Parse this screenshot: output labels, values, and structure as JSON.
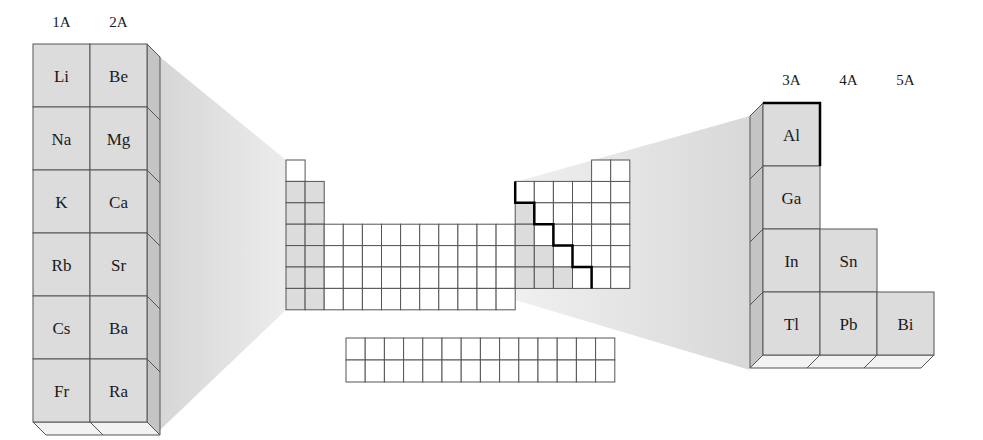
{
  "colors": {
    "background": "#ffffff",
    "cell_gray": "#dcdcdc",
    "cell_white": "#ffffff",
    "side_face": "#c4c4c4",
    "bottom_face": "#f2f2f2",
    "wedge": "#e6e6e6",
    "grid_line": "#555555",
    "staircase_line": "#000000"
  },
  "left_block": {
    "group_labels": [
      "1A",
      "2A"
    ],
    "rows": [
      [
        "Li",
        "Be"
      ],
      [
        "Na",
        "Mg"
      ],
      [
        "K",
        "Ca"
      ],
      [
        "Rb",
        "Sr"
      ],
      [
        "Cs",
        "Ba"
      ],
      [
        "Fr",
        "Ra"
      ]
    ]
  },
  "right_block": {
    "group_labels": [
      "3A",
      "4A",
      "5A"
    ],
    "rows": [
      [
        "Al",
        "",
        ""
      ],
      [
        "Ga",
        "",
        ""
      ],
      [
        "In",
        "Sn",
        ""
      ],
      [
        "Tl",
        "Pb",
        "Bi"
      ]
    ]
  },
  "main_table": {
    "description": "Outline periodic table; groups 1-2 shaded gray below H; metals in p-block shaded gray below staircase line",
    "s_block_columns": 2,
    "d_block_columns": 10,
    "p_block_columns": 6,
    "rows": 7,
    "f_block": {
      "rows": 2,
      "columns": 14
    }
  }
}
